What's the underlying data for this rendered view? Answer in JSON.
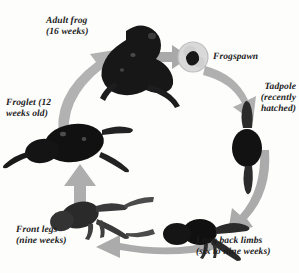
{
  "diagram": {
    "background_color": "#fdfdfc",
    "arrow_color": "#a9a9a9",
    "specimen_color": "#141414",
    "text_color": "#1b1b1b",
    "direction": "clockwise"
  },
  "stages": {
    "adult_frog": {
      "label": "Adult frog\n(16 weeks)",
      "name": "Adult frog",
      "age": "16 weeks"
    },
    "frogspawn": {
      "label": "Frogspawn",
      "name": "Frogspawn",
      "age": ""
    },
    "tadpole": {
      "label": "Tadpole\n(recently\nhatched)",
      "name": "Tadpole",
      "age": "recently hatched"
    },
    "long_back_limbs": {
      "label": "Long back limbs\n(six to nine weeks)",
      "name": "Long back limbs",
      "age": "six to nine weeks"
    },
    "front_legs": {
      "label": "Front legs\n(nine weeks)",
      "name": "Front legs",
      "age": "nine weeks"
    },
    "froglet": {
      "label": "Froglet (12\nweeks old)",
      "name": "Froglet",
      "age": "12 weeks old"
    }
  },
  "arrows": {
    "adult_to_spawn": "arrow-adult-to-frogspawn",
    "spawn_to_tadpole": "arrow-frogspawn-to-tadpole",
    "tadpole_to_limbs": "arrow-tadpole-to-long-back-limbs",
    "limbs_to_front": "arrow-long-back-limbs-to-front-legs",
    "front_to_froglet": "arrow-front-legs-to-froglet",
    "froglet_to_adult": "arrow-froglet-to-adult-frog"
  }
}
